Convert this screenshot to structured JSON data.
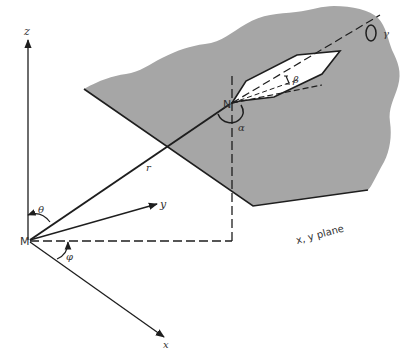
{
  "diagram": {
    "colors": {
      "plane_fill": "#a6a6a6",
      "line": "#1e1e1e",
      "ship_fill": "#ffffff",
      "background": "#ffffff"
    },
    "points": {
      "origin": "M",
      "target": "N"
    },
    "axes": {
      "z": "z",
      "y": "y",
      "x": "x"
    },
    "vectors": {
      "range": "r"
    },
    "angles": {
      "polar": "θ",
      "azimuth": "φ",
      "heading": "α",
      "pitch": "β",
      "roll": "γ"
    },
    "plane_label": "x, y plane"
  }
}
